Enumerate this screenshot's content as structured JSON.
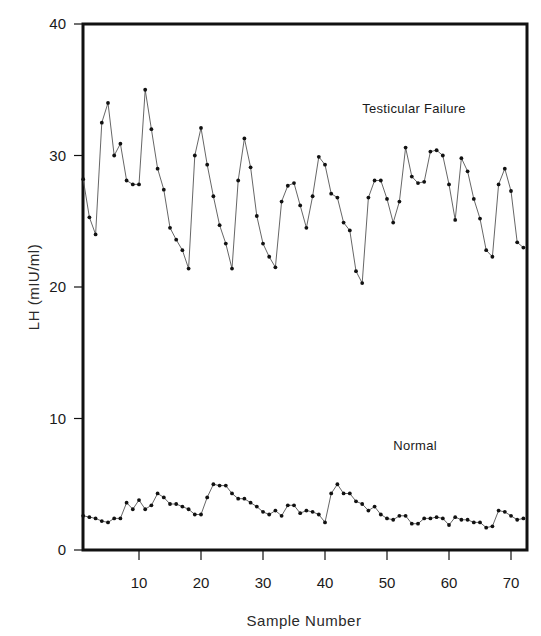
{
  "chart_data": {
    "type": "line",
    "title": "",
    "xlabel": "Sample Number",
    "ylabel": "LH (mIU/ml)",
    "xlim": [
      1,
      72
    ],
    "ylim": [
      0,
      40
    ],
    "x_ticks": [
      10,
      20,
      30,
      40,
      50,
      60,
      70
    ],
    "y_ticks": [
      0,
      10,
      20,
      30,
      40
    ],
    "grid": false,
    "legend": "inline labels",
    "x": [
      1,
      2,
      3,
      4,
      5,
      6,
      7,
      8,
      9,
      10,
      11,
      12,
      13,
      14,
      15,
      16,
      17,
      18,
      19,
      20,
      21,
      22,
      23,
      24,
      25,
      26,
      27,
      28,
      29,
      30,
      31,
      32,
      33,
      34,
      35,
      36,
      37,
      38,
      39,
      40,
      41,
      42,
      43,
      44,
      45,
      46,
      47,
      48,
      49,
      50,
      51,
      52,
      53,
      54,
      55,
      56,
      57,
      58,
      59,
      60,
      61,
      62,
      63,
      64,
      65,
      66,
      67,
      68,
      69,
      70,
      71,
      72
    ],
    "series": [
      {
        "name": "Testicular Failure",
        "label_position": {
          "x": 46,
          "y": 33.2
        },
        "values": [
          28.2,
          25.3,
          24.0,
          32.5,
          34.0,
          30.0,
          30.9,
          28.1,
          27.8,
          27.8,
          35.0,
          32.0,
          29.0,
          27.4,
          24.5,
          23.6,
          22.8,
          21.4,
          30.0,
          32.1,
          29.3,
          26.9,
          24.7,
          23.3,
          21.4,
          28.1,
          31.3,
          29.1,
          25.4,
          23.3,
          22.3,
          21.5,
          26.5,
          27.7,
          27.9,
          26.2,
          24.5,
          26.9,
          29.9,
          29.3,
          27.1,
          26.8,
          24.9,
          24.3,
          21.2,
          20.3,
          26.8,
          28.1,
          28.1,
          26.7,
          24.9,
          26.5,
          30.6,
          28.4,
          27.9,
          28.0,
          30.3,
          30.4,
          30.0,
          27.8,
          25.1,
          29.8,
          28.8,
          26.7,
          25.2,
          22.8,
          22.3,
          27.8,
          29.0,
          27.3,
          23.4,
          23.0
        ]
      },
      {
        "name": "Normal",
        "label_position": {
          "x": 51,
          "y": 7.6
        },
        "values": [
          2.6,
          2.5,
          2.4,
          2.2,
          2.1,
          2.4,
          2.4,
          3.6,
          3.1,
          3.8,
          3.1,
          3.4,
          4.3,
          4.0,
          3.5,
          3.5,
          3.3,
          3.1,
          2.7,
          2.7,
          4.0,
          5.0,
          4.9,
          4.9,
          4.3,
          3.9,
          3.9,
          3.6,
          3.3,
          2.9,
          2.7,
          3.0,
          2.6,
          3.4,
          3.4,
          2.8,
          3.0,
          2.9,
          2.7,
          2.1,
          4.3,
          5.0,
          4.3,
          4.3,
          3.7,
          3.5,
          3.0,
          3.3,
          2.7,
          2.4,
          2.3,
          2.6,
          2.6,
          2.0,
          2.0,
          2.4,
          2.4,
          2.5,
          2.4,
          1.9,
          2.5,
          2.3,
          2.3,
          2.1,
          2.1,
          1.7,
          1.8,
          3.0,
          2.9,
          2.6,
          2.3,
          2.4
        ]
      }
    ]
  },
  "colors": {
    "frame": "#111111",
    "line": "#555555",
    "marker": "#111111",
    "text": "#1a1a1a"
  }
}
